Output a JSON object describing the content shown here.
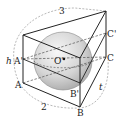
{
  "diagram": {
    "type": "geometry",
    "vertices": {
      "A": "A",
      "A_prime": "A'",
      "B": "B",
      "B_prime": "B'",
      "C": "C",
      "C_prime": "C'",
      "O_prime": "O'"
    },
    "dimension_labels": {
      "top": "3",
      "left": "h",
      "bottom": "2",
      "right": "t"
    },
    "colors": {
      "line": "#222222",
      "dashed": "#888888",
      "sphere_light": "#f2f2f2",
      "sphere_dark": "#b5b5b5"
    }
  }
}
